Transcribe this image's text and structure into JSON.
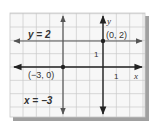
{
  "figure": {
    "type": "coordinate-graph",
    "grid": {
      "left": 10,
      "top": 13,
      "right": 145,
      "bottom": 117,
      "cell": 13.33,
      "line_color": "#c8c8c8",
      "background": "#f7f7f7",
      "shadow_color": "#9a9a9a"
    },
    "origin_px": {
      "x": 103,
      "y": 67
    },
    "axes": {
      "x_label": "x",
      "y_label": "y",
      "color": "#222222",
      "x_tick_label": "1",
      "y_tick_label": "1"
    },
    "lines": [
      {
        "id": "horizontal",
        "equation_label": "y = 2",
        "value": 2,
        "orientation": "horizontal",
        "color": "#555555"
      },
      {
        "id": "vertical",
        "equation_label": "x = −3",
        "value": -3,
        "orientation": "vertical",
        "color": "#555555"
      }
    ],
    "points": [
      {
        "label": "(0, 2)",
        "x": 0,
        "y": 2
      },
      {
        "label": "(−3, 0)",
        "x": -3,
        "y": 0
      }
    ],
    "text_color": "#333333"
  }
}
